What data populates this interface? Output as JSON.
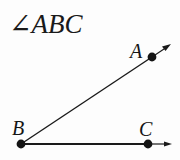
{
  "figure": {
    "title": "∠ABC",
    "background_color": "#fdfdfd",
    "stroke_color": "#1a1a1a",
    "width": 180,
    "height": 160,
    "labels": {
      "a": "A",
      "b": "B",
      "c": "C"
    },
    "points": {
      "vertex_b": {
        "x": 21,
        "y": 144
      },
      "point_a": {
        "x": 152,
        "y": 57
      },
      "point_c": {
        "x": 148,
        "y": 144
      },
      "ray_ba_tip": {
        "x": 171,
        "y": 45
      },
      "ray_bc_tip": {
        "x": 172,
        "y": 144
      }
    },
    "dot_radius": 4.2,
    "line_width": 1.4
  }
}
